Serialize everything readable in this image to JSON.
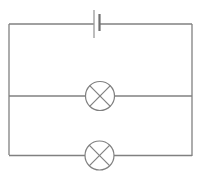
{
  "diagram": {
    "type": "circuit",
    "colors": {
      "wire": "#808080",
      "background": "#ffffff"
    },
    "components": [
      {
        "id": "battery",
        "kind": "cell",
        "icon": "battery-icon"
      },
      {
        "id": "lamp1",
        "kind": "lamp",
        "icon": "lamp-icon"
      },
      {
        "id": "lamp2",
        "kind": "lamp",
        "icon": "lamp-icon"
      }
    ]
  }
}
